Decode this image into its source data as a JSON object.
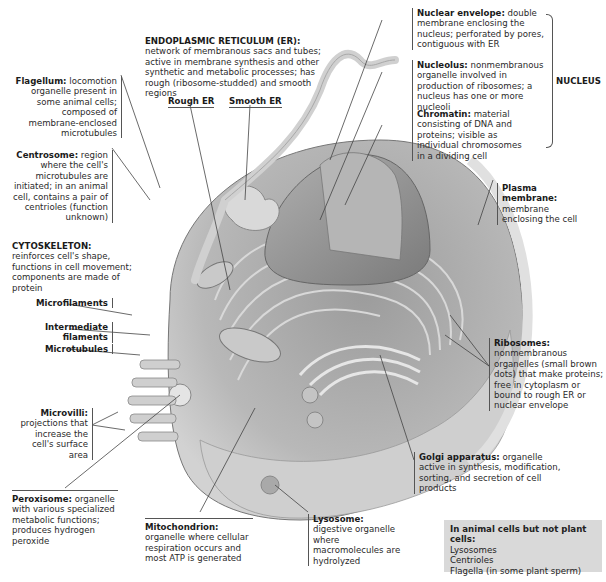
{
  "labels": {
    "er": {
      "name": "ENDOPLASMIC RETICULUM (ER):",
      "desc": "network of membranous sacs and tubes; active in membrane synthesis and other synthetic and metabolic processes; has rough (ribosome-studded) and smooth regions"
    },
    "rough_er": "Rough ER",
    "smooth_er": "Smooth ER",
    "flagellum": {
      "name": "Flagellum:",
      "desc": "locomotion organelle present in some animal cells; composed of membrane-enclosed microtubules"
    },
    "centrosome": {
      "name": "Centrosome:",
      "desc": "region where the cell's microtubules are initiated; in an animal cell, contains a pair of centrioles (function unknown)"
    },
    "cytoskeleton": {
      "name": "CYTOSKELETON:",
      "desc": "reinforces cell's shape, functions in cell movement; components are made of protein"
    },
    "microfilaments": "Microfilaments",
    "intermediate_filaments": "Intermediate filaments",
    "microtubules": "Microtubules",
    "microvilli": {
      "name": "Microvilli:",
      "desc": "projections that increase the cell's surface area"
    },
    "peroxisome": {
      "name": "Peroxisome:",
      "desc": "organelle with various specialized metabolic functions; produces hydrogen peroxide"
    },
    "mitochondrion": {
      "name": "Mitochondrion:",
      "desc": "organelle where cellular respiration occurs and most ATP is generated"
    },
    "lysosome": {
      "name": "Lysosome:",
      "desc": "digestive organelle where macromolecules are hydrolyzed"
    },
    "golgi": {
      "name": "Golgi apparatus:",
      "desc": "organelle active in synthesis, modification, sorting, and secretion of cell products"
    },
    "ribosomes": {
      "name": "Ribosomes:",
      "desc": "nonmembranous organelles (small brown dots) that make proteins; free in cytoplasm or bound to rough ER or nuclear envelope"
    },
    "plasma_membrane": {
      "name": "Plasma membrane:",
      "desc": "membrane enclosing the cell"
    },
    "nuclear_envelope": {
      "name": "Nuclear envelope:",
      "desc": "double membrane enclosing the nucleus; perforated by pores, contiguous with ER"
    },
    "nucleolus": {
      "name": "Nucleolus:",
      "desc": "nonmembranous organelle involved in production of ribosomes; a nucleus has one or more nucleoli"
    },
    "chromatin": {
      "name": "Chromatin:",
      "desc": "material consisting of DNA and proteins; visible as individual chromosomes in a dividing cell"
    },
    "nucleus": "NUCLEUS"
  },
  "animal_box": {
    "title": "In animal cells but not plant cells:",
    "items": [
      "Lysosomes",
      "Centrioles",
      "Flagella (in some plant sperm)"
    ]
  },
  "colors": {
    "cell_fill": "#bdbdbd",
    "cell_dark": "#8a8a8a",
    "box_bg": "#d9d9d9",
    "leader": "#444444"
  }
}
